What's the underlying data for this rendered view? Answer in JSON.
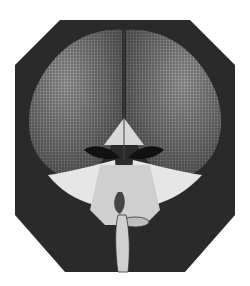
{
  "image": {
    "subject": "engraving of a fly's head with compound eyes",
    "style": "black-and-white copperplate engraving",
    "caption": "",
    "colors": {
      "background": "#ffffff",
      "dark_fill": "#2a2a2a",
      "eye_shade": "#6e6e6e",
      "hair_light": "#e6e6e6"
    }
  }
}
